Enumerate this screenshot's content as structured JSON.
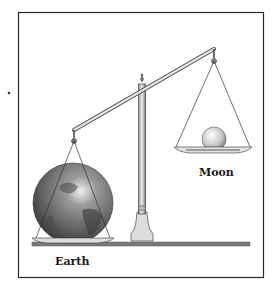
{
  "figure": {
    "labels": {
      "left": "Earth",
      "right": "Moon"
    },
    "colors": {
      "frame": "#2a2a2a",
      "ground": "#7a7a7a",
      "earth": "#5a5a5a",
      "moon": "#cfcfcf"
    }
  }
}
